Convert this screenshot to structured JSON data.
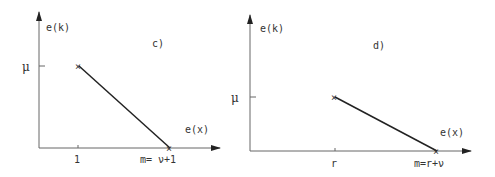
{
  "panels": [
    {
      "id": "c",
      "label": "c)",
      "y_axis_label": "e(k)",
      "x_axis_label": "e(x)",
      "y_tick_label": "μ",
      "x_tick_start_label": "1",
      "x_tick_end_label": "m= ν+1",
      "marker": "×"
    },
    {
      "id": "d",
      "label": "d)",
      "y_axis_label": "e(k)",
      "x_axis_label": "e(x)",
      "y_tick_label": "μ",
      "x_tick_start_label": "r",
      "x_tick_end_label": "m=r+ν",
      "marker": "×"
    }
  ],
  "colors": {
    "line": "#222222",
    "axis": "#555555",
    "text": "#333333"
  }
}
